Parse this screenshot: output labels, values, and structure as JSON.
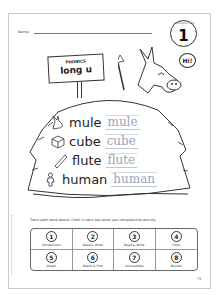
{
  "worksheet": {
    "name_label": "Name:",
    "lesson_badge": {
      "arc_text": "INTRODUCTION",
      "number": "1"
    },
    "sign": {
      "subject": "PHONICS",
      "topic": "long u"
    },
    "speech_bubble": "Hi!",
    "words": [
      {
        "word": "mule",
        "trace": "mule",
        "picture": "mule-icon"
      },
      {
        "word": "cube",
        "trace": "cube",
        "picture": "cube-icon"
      },
      {
        "word": "flute",
        "trace": "flute",
        "picture": "flute-icon"
      },
      {
        "word": "human",
        "trace": "human",
        "picture": "human-icon"
      }
    ],
    "instructions": "Trace each word above. Color in each box when you complete the activity.",
    "activities": [
      {
        "num": "1",
        "label": "Introduction"
      },
      {
        "num": "2",
        "label": "Read & Write"
      },
      {
        "num": "3",
        "label": "Read & Write"
      },
      {
        "num": "4",
        "label": "Color"
      },
      {
        "num": "5",
        "label": "Graph"
      },
      {
        "num": "6",
        "label": "Match & Find"
      },
      {
        "num": "7",
        "label": "Unscramble"
      },
      {
        "num": "8",
        "label": "Review"
      }
    ],
    "page_number": "75"
  }
}
